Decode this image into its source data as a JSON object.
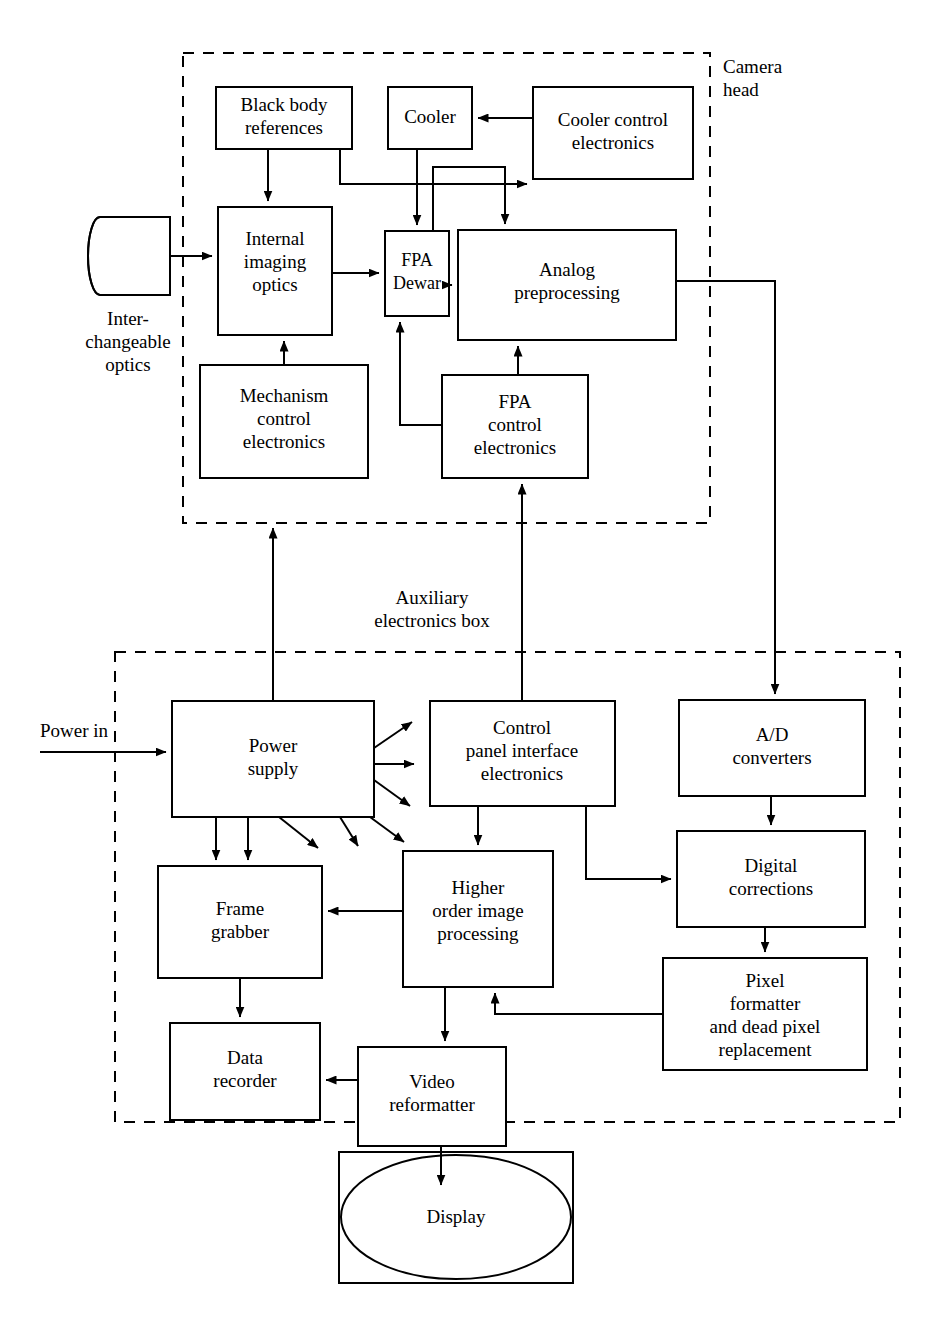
{
  "diagram": {
    "type": "block-diagram",
    "background": "#ffffff",
    "line_color": "#000000"
  },
  "groups": [
    {
      "id": "camera-head",
      "label_line1": "Camera",
      "label_line2": "head",
      "x": 183,
      "y": 53,
      "w": 527,
      "h": 470,
      "style": "dashed"
    },
    {
      "id": "aux-box",
      "label_line1": "Auxiliary",
      "label_line2": "electronics box",
      "x": 115,
      "y": 652,
      "w": 785,
      "h": 470,
      "style": "dashed"
    }
  ],
  "blocks": [
    {
      "id": "interchangeable-optics",
      "lines": [],
      "x": 88,
      "y": 217,
      "w": 82,
      "h": 78,
      "shape": "cylinder",
      "caption": [
        "Inter-",
        "changeable",
        "optics"
      ]
    },
    {
      "id": "black-body-references",
      "lines": [
        "Black body",
        "references"
      ],
      "x": 216,
      "y": 87,
      "w": 136,
      "h": 62
    },
    {
      "id": "cooler",
      "lines": [
        "Cooler"
      ],
      "x": 388,
      "y": 87,
      "w": 84,
      "h": 62
    },
    {
      "id": "cooler-control-electronics",
      "lines": [
        "Cooler control",
        "electronics"
      ],
      "x": 533,
      "y": 87,
      "w": 160,
      "h": 92
    },
    {
      "id": "internal-imaging-optics",
      "lines": [
        "Internal",
        "imaging",
        "optics"
      ],
      "x": 218,
      "y": 207,
      "w": 114,
      "h": 128
    },
    {
      "id": "fpa-dewar",
      "lines": [
        "FPA",
        "Dewar"
      ],
      "x": 385,
      "y": 231,
      "w": 64,
      "h": 85
    },
    {
      "id": "analog-preprocessing",
      "lines": [
        "Analog",
        "preprocessing"
      ],
      "x": 458,
      "y": 230,
      "w": 218,
      "h": 110
    },
    {
      "id": "mechanism-control-electronics",
      "lines": [
        "Mechanism",
        "control",
        "electronics"
      ],
      "x": 200,
      "y": 365,
      "w": 168,
      "h": 113
    },
    {
      "id": "fpa-control-electronics",
      "lines": [
        "FPA",
        "control",
        "electronics"
      ],
      "x": 442,
      "y": 375,
      "w": 146,
      "h": 103
    },
    {
      "id": "power-supply",
      "lines": [
        "Power",
        "supply"
      ],
      "x": 172,
      "y": 701,
      "w": 202,
      "h": 116
    },
    {
      "id": "control-panel-interface-electronics",
      "lines": [
        "Control",
        "panel interface",
        "electronics"
      ],
      "x": 430,
      "y": 701,
      "w": 185,
      "h": 105
    },
    {
      "id": "ad-converters",
      "lines": [
        "A/D",
        "converters"
      ],
      "x": 679,
      "y": 700,
      "w": 186,
      "h": 96
    },
    {
      "id": "frame-grabber",
      "lines": [
        "Frame",
        "grabber"
      ],
      "x": 158,
      "y": 866,
      "w": 164,
      "h": 112
    },
    {
      "id": "higher-order-image-processing",
      "lines": [
        "Higher",
        "order image",
        "processing"
      ],
      "x": 403,
      "y": 851,
      "w": 150,
      "h": 136
    },
    {
      "id": "digital-corrections",
      "lines": [
        "Digital",
        "corrections"
      ],
      "x": 677,
      "y": 831,
      "w": 188,
      "h": 96
    },
    {
      "id": "data-recorder",
      "lines": [
        "Data",
        "recorder"
      ],
      "x": 170,
      "y": 1023,
      "w": 150,
      "h": 97
    },
    {
      "id": "video-reformatter",
      "lines": [
        "Video",
        "reformatter"
      ],
      "x": 358,
      "y": 1047,
      "w": 148,
      "h": 99
    },
    {
      "id": "pixel-formatter",
      "lines": [
        "Pixel",
        "formatter",
        "and dead pixel",
        "replacement"
      ],
      "x": 663,
      "y": 958,
      "w": 204,
      "h": 112
    },
    {
      "id": "display",
      "lines": [
        "Display"
      ],
      "x": 339,
      "y": 1152,
      "w": 234,
      "h": 131,
      "shape": "display"
    }
  ],
  "free_labels": [
    {
      "id": "power-in",
      "text": "Power in",
      "x": 40,
      "y": 740,
      "align": "start"
    }
  ],
  "connections": [
    {
      "from": "interchangeable-optics",
      "to": "internal-imaging-optics"
    },
    {
      "from": "black-body-references",
      "to": "internal-imaging-optics"
    },
    {
      "from": "black-body-references",
      "to": "fpa-dewar"
    },
    {
      "from": "cooler-control-electronics",
      "to": "cooler"
    },
    {
      "from": "cooler",
      "to": "fpa-dewar"
    },
    {
      "from": "cooler-control-electronics",
      "to": "analog-preprocessing"
    },
    {
      "from": "fpa-dewar",
      "to": "cooler-control-electronics"
    },
    {
      "from": "internal-imaging-optics",
      "to": "fpa-dewar"
    },
    {
      "from": "fpa-dewar",
      "to": "analog-preprocessing"
    },
    {
      "from": "mechanism-control-electronics",
      "to": "internal-imaging-optics"
    },
    {
      "from": "fpa-control-electronics",
      "to": "fpa-dewar"
    },
    {
      "from": "fpa-control-electronics",
      "to": "analog-preprocessing"
    },
    {
      "from": "analog-preprocessing",
      "to": "ad-converters"
    },
    {
      "from": "power-in",
      "to": "power-supply"
    },
    {
      "from": "power-supply",
      "to": "camera-head"
    },
    {
      "from": "power-supply",
      "to": "frame-grabber"
    },
    {
      "from": "control-panel-interface-electronics",
      "to": "fpa-control-electronics"
    },
    {
      "from": "control-panel-interface-electronics",
      "to": "higher-order-image-processing"
    },
    {
      "from": "control-panel-interface-electronics",
      "to": "digital-corrections"
    },
    {
      "from": "ad-converters",
      "to": "digital-corrections"
    },
    {
      "from": "digital-corrections",
      "to": "pixel-formatter"
    },
    {
      "from": "pixel-formatter",
      "to": "higher-order-image-processing"
    },
    {
      "from": "higher-order-image-processing",
      "to": "frame-grabber"
    },
    {
      "from": "higher-order-image-processing",
      "to": "video-reformatter"
    },
    {
      "from": "frame-grabber",
      "to": "data-recorder"
    },
    {
      "from": "video-reformatter",
      "to": "data-recorder"
    },
    {
      "from": "video-reformatter",
      "to": "display"
    }
  ]
}
